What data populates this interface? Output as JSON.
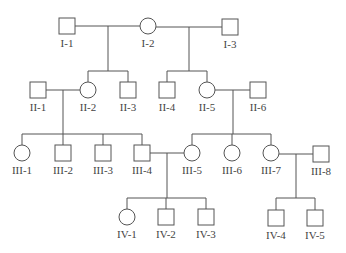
{
  "diagram": {
    "type": "pedigree",
    "colors": {
      "line": "#555555",
      "text": "#444444",
      "background": "#ffffff"
    },
    "individuals": [
      {
        "id": "I-1",
        "label": "I-1",
        "sex": "male",
        "cx": 67,
        "cy": 26
      },
      {
        "id": "I-2",
        "label": "I-2",
        "sex": "female",
        "cx": 148,
        "cy": 26
      },
      {
        "id": "I-3",
        "label": "I-3",
        "sex": "male",
        "cx": 230,
        "cy": 27
      },
      {
        "id": "II-1",
        "label": "II-1",
        "sex": "male",
        "cx": 38,
        "cy": 90
      },
      {
        "id": "II-2",
        "label": "II-2",
        "sex": "female",
        "cx": 88,
        "cy": 90
      },
      {
        "id": "II-3",
        "label": "II-3",
        "sex": "male",
        "cx": 128,
        "cy": 90
      },
      {
        "id": "II-4",
        "label": "II-4",
        "sex": "male",
        "cx": 167,
        "cy": 90
      },
      {
        "id": "II-5",
        "label": "II-5",
        "sex": "female",
        "cx": 207,
        "cy": 90
      },
      {
        "id": "II-6",
        "label": "II-6",
        "sex": "male",
        "cx": 258,
        "cy": 90
      },
      {
        "id": "III-1",
        "label": "III-1",
        "sex": "female",
        "cx": 22,
        "cy": 153
      },
      {
        "id": "III-2",
        "label": "III-2",
        "sex": "male",
        "cx": 63,
        "cy": 153
      },
      {
        "id": "III-3",
        "label": "III-3",
        "sex": "male",
        "cx": 103,
        "cy": 153
      },
      {
        "id": "III-4",
        "label": "III-4",
        "sex": "male",
        "cx": 142,
        "cy": 153
      },
      {
        "id": "III-5",
        "label": "III-5",
        "sex": "female",
        "cx": 192,
        "cy": 153
      },
      {
        "id": "III-6",
        "label": "III-6",
        "sex": "female",
        "cx": 232,
        "cy": 153
      },
      {
        "id": "III-7",
        "label": "III-7",
        "sex": "female",
        "cx": 271,
        "cy": 153
      },
      {
        "id": "III-8",
        "label": "III-8",
        "sex": "male",
        "cx": 321,
        "cy": 154
      },
      {
        "id": "IV-1",
        "label": "IV-1",
        "sex": "female",
        "cx": 127,
        "cy": 217
      },
      {
        "id": "IV-2",
        "label": "IV-2",
        "sex": "male",
        "cx": 166,
        "cy": 217
      },
      {
        "id": "IV-3",
        "label": "IV-3",
        "sex": "male",
        "cx": 206,
        "cy": 217
      },
      {
        "id": "IV-4",
        "label": "IV-4",
        "sex": "male",
        "cx": 276,
        "cy": 218
      },
      {
        "id": "IV-5",
        "label": "IV-5",
        "sex": "male",
        "cx": 315,
        "cy": 218
      }
    ],
    "couples": [
      {
        "partners": [
          "I-1",
          "I-2"
        ],
        "children": [
          "II-2",
          "II-3"
        ]
      },
      {
        "partners": [
          "I-2",
          "I-3"
        ],
        "children": [
          "II-4",
          "II-5"
        ]
      },
      {
        "partners": [
          "II-1",
          "II-2"
        ],
        "children": [
          "III-1",
          "III-2",
          "III-3",
          "III-4"
        ]
      },
      {
        "partners": [
          "II-5",
          "II-6"
        ],
        "children": [
          "III-5",
          "III-6",
          "III-7"
        ]
      },
      {
        "partners": [
          "III-4",
          "III-5"
        ],
        "children": [
          "IV-1",
          "IV-2",
          "IV-3"
        ]
      },
      {
        "partners": [
          "III-7",
          "III-8"
        ],
        "children": [
          "IV-4",
          "IV-5"
        ]
      }
    ],
    "sibship_bar_y": [
      71,
      71,
      134,
      134,
      198,
      198
    ],
    "symbol_size": 16,
    "label_offset": 17
  }
}
